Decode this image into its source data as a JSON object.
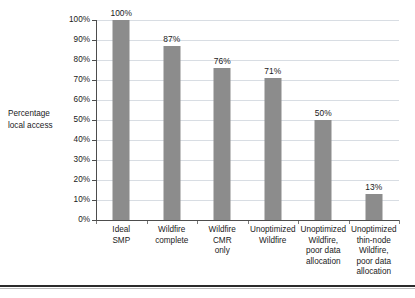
{
  "chart_data": {
    "type": "bar",
    "title": "",
    "xlabel": "",
    "ylabel": "Percentage local access",
    "ylim": [
      0,
      100
    ],
    "grid": true,
    "legend": "none",
    "bar_color": "#8c8c8c",
    "categories": [
      "Ideal SMP",
      "Wildfire complete",
      "Wildfire CMR only",
      "Unoptimized Wildfire",
      "Unoptimized Wildfire, poor data allocation",
      "Unoptimized thin-node Wildfire, poor data allocation"
    ],
    "category_lines": [
      [
        "Ideal",
        "SMP"
      ],
      [
        "Wildfire",
        "complete"
      ],
      [
        "Wildfire",
        "CMR",
        "only"
      ],
      [
        "Unoptimized",
        "Wildfire"
      ],
      [
        "Unoptimized",
        "Wildfire,",
        "poor data",
        "allocation"
      ],
      [
        "Unoptimized",
        "thin-node",
        "Wildfire,",
        "poor data",
        "allocation"
      ]
    ],
    "values": [
      100,
      87,
      76,
      71,
      50,
      13
    ],
    "value_labels": [
      "100%",
      "87%",
      "76%",
      "71%",
      "50%",
      "13%"
    ],
    "ytick_values": [
      0,
      10,
      20,
      30,
      40,
      50,
      60,
      70,
      80,
      90,
      100
    ],
    "ytick_labels": [
      "0%",
      "10%",
      "20%",
      "30%",
      "40%",
      "50%",
      "60%",
      "70%",
      "80%",
      "90%",
      "100%"
    ]
  },
  "axis": {
    "y_title_lines": [
      "Percentage",
      "local access"
    ]
  }
}
